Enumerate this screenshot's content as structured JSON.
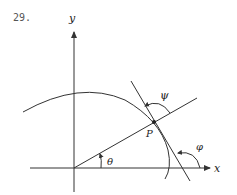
{
  "problem": {
    "number": "29."
  },
  "labels": {
    "y_axis": "y",
    "x_axis": "x",
    "point": "P",
    "theta": "θ",
    "psi": "ψ",
    "phi": "φ"
  },
  "colors": {
    "stroke": "#333333",
    "background": "#ffffff"
  }
}
